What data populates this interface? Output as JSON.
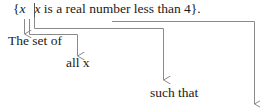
{
  "expression": {
    "open_brace": "{",
    "variable": "x",
    "bar": "",
    "condition_variable": "x",
    "condition_text": " is a real number less than 4",
    "close": "}."
  },
  "annotations": [
    {
      "id": "set-of",
      "label": "The set of",
      "points_to": "{"
    },
    {
      "id": "all-x",
      "label": "all x",
      "points_to": "x"
    },
    {
      "id": "such-that",
      "label": "such that",
      "points_to": "|"
    },
    {
      "id": "condition",
      "label": "",
      "points_to": "x is a real number less than 4"
    }
  ],
  "colors": {
    "text": "#1a1a1a",
    "connector": "#8a8a8a"
  }
}
